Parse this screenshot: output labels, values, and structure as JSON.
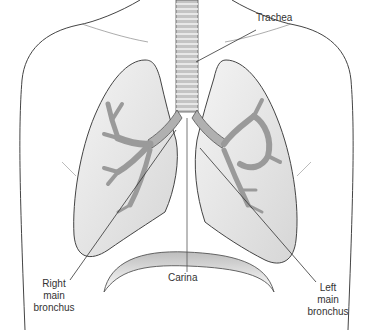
{
  "diagram": {
    "labels": {
      "trachea": "Trachea",
      "carina": "Carina",
      "right_bronchus": [
        "Right",
        "main",
        "bronchus"
      ],
      "left_bronchus": [
        "Left",
        "main",
        "bronchus"
      ]
    },
    "colors": {
      "outline": "#333333",
      "lung_fill": "#e6e6e6",
      "airway_fill": "#b8b8b8",
      "diaphragm_shade": "#c8c8c8"
    }
  }
}
